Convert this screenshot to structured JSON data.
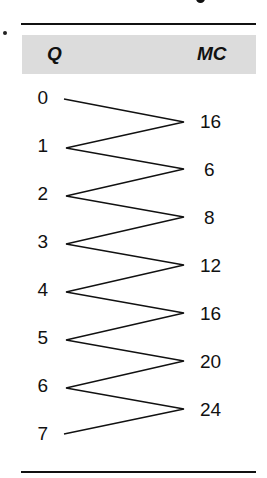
{
  "table": {
    "headers": {
      "q": "Q",
      "mc": "MC"
    },
    "quantities": [
      "0",
      "1",
      "2",
      "3",
      "4",
      "5",
      "6",
      "7"
    ],
    "marginal_costs": [
      "16",
      "6",
      "8",
      "12",
      "16",
      "20",
      "24"
    ]
  },
  "colors": {
    "header_band": "#dcdcdc",
    "rules": "#111111",
    "text": "#111111"
  }
}
